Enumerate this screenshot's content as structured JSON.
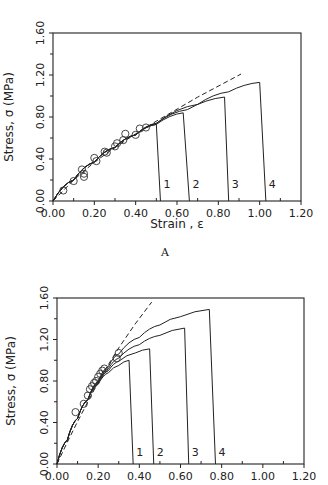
{
  "chart_data": [
    {
      "type": "line",
      "panel_label": "A",
      "title": "",
      "xlabel": "Strain , ε",
      "ylabel": "Stress, σ (MPa)",
      "xlim": [
        0,
        1.2
      ],
      "ylim": [
        0,
        1.6
      ],
      "xticks": [
        "0.00",
        "0.20",
        "0.40",
        "0.60",
        "0.80",
        "1.00",
        "1.20"
      ],
      "yticks": [
        "0.00",
        "0.40",
        "0.80",
        "1.20",
        "1.60"
      ],
      "grid": false,
      "series": [
        {
          "name": "1",
          "style": "solid",
          "x": [
            0,
            0.1,
            0.2,
            0.3,
            0.4,
            0.5,
            0.52
          ],
          "y": [
            0,
            0.2,
            0.37,
            0.51,
            0.63,
            0.73,
            0
          ]
        },
        {
          "name": "2",
          "style": "solid",
          "x": [
            0,
            0.1,
            0.2,
            0.3,
            0.4,
            0.5,
            0.63,
            0.66
          ],
          "y": [
            0,
            0.2,
            0.37,
            0.51,
            0.63,
            0.73,
            0.84,
            0
          ]
        },
        {
          "name": "3",
          "style": "solid",
          "x": [
            0,
            0.1,
            0.2,
            0.3,
            0.4,
            0.5,
            0.65,
            0.83,
            0.85
          ],
          "y": [
            0,
            0.2,
            0.37,
            0.51,
            0.63,
            0.74,
            0.87,
            0.99,
            0
          ]
        },
        {
          "name": "4",
          "style": "solid",
          "x": [
            0,
            0.1,
            0.2,
            0.3,
            0.4,
            0.5,
            0.7,
            0.85,
            1.0,
            1.03
          ],
          "y": [
            0,
            0.2,
            0.37,
            0.51,
            0.63,
            0.74,
            0.92,
            1.04,
            1.13,
            0
          ]
        },
        {
          "name": "fit",
          "style": "dashed",
          "x": [
            0,
            0.1,
            0.2,
            0.3,
            0.4,
            0.5,
            0.7,
            0.91
          ],
          "y": [
            0,
            0.2,
            0.37,
            0.51,
            0.64,
            0.76,
            0.99,
            1.21
          ]
        }
      ],
      "markers": {
        "name": "experimental data",
        "x": [
          0.05,
          0.1,
          0.14,
          0.15,
          0.15,
          0.2,
          0.21,
          0.25,
          0.26,
          0.3,
          0.31,
          0.34,
          0.35,
          0.4,
          0.42,
          0.45
        ],
        "y": [
          0.1,
          0.19,
          0.3,
          0.26,
          0.23,
          0.41,
          0.38,
          0.47,
          0.46,
          0.52,
          0.55,
          0.58,
          0.64,
          0.63,
          0.69,
          0.7
        ]
      },
      "curve_labels": [
        "1",
        "2",
        "3",
        "4"
      ]
    },
    {
      "type": "line",
      "panel_label": "",
      "title": "",
      "xlabel": "",
      "ylabel": "Stress, σ (MPa)",
      "xlim": [
        0,
        1.2
      ],
      "ylim": [
        0,
        1.6
      ],
      "xticks": [
        "0.00",
        "0.20",
        "0.40",
        "0.60",
        "0.80",
        "1.00",
        "1.20"
      ],
      "yticks": [
        "0.00",
        "0.40",
        "0.80",
        "1.20",
        "1.60"
      ],
      "grid": false,
      "series": [
        {
          "name": "1",
          "style": "solid",
          "x": [
            0,
            0.05,
            0.1,
            0.15,
            0.2,
            0.25,
            0.3,
            0.35,
            0.37
          ],
          "y": [
            0,
            0.23,
            0.44,
            0.62,
            0.77,
            0.88,
            0.95,
            1.0,
            0
          ]
        },
        {
          "name": "2",
          "style": "solid",
          "x": [
            0,
            0.05,
            0.1,
            0.15,
            0.2,
            0.25,
            0.3,
            0.38,
            0.45,
            0.47
          ],
          "y": [
            0,
            0.23,
            0.44,
            0.62,
            0.78,
            0.9,
            0.99,
            1.07,
            1.11,
            0
          ]
        },
        {
          "name": "3",
          "style": "solid",
          "x": [
            0,
            0.05,
            0.1,
            0.15,
            0.2,
            0.25,
            0.3,
            0.4,
            0.5,
            0.62,
            0.64
          ],
          "y": [
            0,
            0.23,
            0.44,
            0.62,
            0.79,
            0.92,
            1.02,
            1.15,
            1.24,
            1.31,
            0
          ]
        },
        {
          "name": "4",
          "style": "solid",
          "x": [
            0,
            0.05,
            0.1,
            0.15,
            0.2,
            0.25,
            0.3,
            0.4,
            0.5,
            0.6,
            0.74,
            0.77
          ],
          "y": [
            0,
            0.23,
            0.44,
            0.62,
            0.8,
            0.94,
            1.06,
            1.22,
            1.34,
            1.42,
            1.49,
            0
          ]
        },
        {
          "name": "fit",
          "style": "dashed",
          "x": [
            0,
            0.05,
            0.1,
            0.15,
            0.2,
            0.25,
            0.3,
            0.38,
            0.46
          ],
          "y": [
            0,
            0.21,
            0.41,
            0.6,
            0.79,
            0.96,
            1.12,
            1.35,
            1.56
          ]
        }
      ],
      "markers": {
        "name": "experimental data",
        "x": [
          0.09,
          0.13,
          0.15,
          0.16,
          0.17,
          0.18,
          0.19,
          0.2,
          0.21,
          0.22,
          0.23,
          0.29,
          0.3
        ],
        "y": [
          0.5,
          0.58,
          0.66,
          0.72,
          0.75,
          0.78,
          0.8,
          0.84,
          0.87,
          0.9,
          0.92,
          1.02,
          1.07
        ]
      },
      "curve_labels": [
        "1",
        "2",
        "3",
        "4"
      ]
    }
  ]
}
